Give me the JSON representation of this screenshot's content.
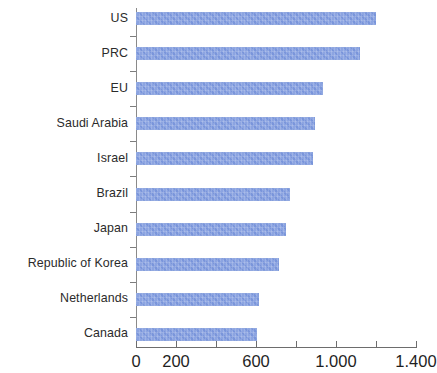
{
  "chart_data": {
    "type": "bar",
    "orientation": "horizontal",
    "title": "",
    "subtitle": "",
    "xlabel": "",
    "ylabel": "",
    "categories": [
      "US",
      "PRC",
      "EU",
      "Saudi Arabia",
      "Israel",
      "Brazil",
      "Japan",
      "Republic of Korea",
      "Netherlands",
      "Canada"
    ],
    "values": [
      1200,
      1120,
      935,
      895,
      885,
      770,
      750,
      715,
      615,
      605
    ],
    "series": [
      {
        "name": "",
        "values": [
          1200,
          1120,
          935,
          895,
          885,
          770,
          750,
          715,
          615,
          605
        ]
      }
    ],
    "xlim": [
      0,
      1400
    ],
    "ylim": null,
    "grid": false,
    "legend": false,
    "legend_position": "none",
    "bar_color": "#7f9ade",
    "axis_color": "#6d6d6d",
    "label_color": "#2b2b2b",
    "tick_values": [
      0,
      200,
      400,
      600,
      800,
      1000,
      1200,
      1400
    ],
    "tick_labels": [
      "0",
      "200",
      "",
      "600",
      "",
      "1.000",
      "",
      "1.400"
    ],
    "annotations": []
  },
  "axis": {
    "ticks": [
      {
        "value": 0,
        "label": "0"
      },
      {
        "value": 200,
        "label": "200"
      },
      {
        "value": 400,
        "label": ""
      },
      {
        "value": 600,
        "label": "600"
      },
      {
        "value": 800,
        "label": ""
      },
      {
        "value": 1000,
        "label": "1.000"
      },
      {
        "value": 1200,
        "label": ""
      },
      {
        "value": 1400,
        "label": "1.400"
      }
    ]
  }
}
